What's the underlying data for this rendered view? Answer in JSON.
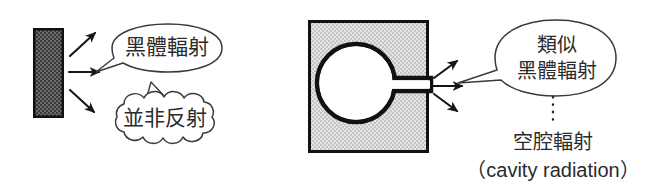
{
  "figure": {
    "title_text": "",
    "background_color": "#ffffff",
    "ink_color": "#1a1a1a",
    "text_color": "#2b2b2b"
  },
  "left_panel": {
    "name": "blackbody-slab-panel",
    "slab": {
      "name": "blackbody-slab",
      "fill_color": "#575757",
      "border_color": "#111111",
      "pattern": "checkered-dither-dark"
    },
    "emission_arrows": {
      "name": "emission-arrows",
      "count": 3,
      "directions": [
        "up-right",
        "right",
        "down-right"
      ]
    },
    "callout_bubble": {
      "name": "blackbody-radiation-bubble",
      "shape": "oval-speech-bubble",
      "label": "黑體輻射"
    },
    "thought_bubble": {
      "name": "not-reflection-bubble",
      "shape": "cloud-bubble",
      "label": "並非反射"
    }
  },
  "right_panel": {
    "name": "cavity-panel",
    "cavity_block": {
      "name": "cavity-block",
      "fill_color": "#d8d8d8",
      "border_color": "#111111",
      "pattern": "checkered-dither-light",
      "cavity_fill": "#ffffff"
    },
    "emission_arrows": {
      "name": "cavity-emission-arrows",
      "count": 3,
      "directions": [
        "up-right",
        "right",
        "down-right"
      ]
    },
    "callout_bubble": {
      "name": "similar-blackbody-bubble",
      "shape": "oval-speech-bubble",
      "label_line1": "類似",
      "label_line2": "黑體輻射"
    },
    "connector": {
      "name": "dotted-connector",
      "style": "dotted-vertical"
    },
    "caption": {
      "name": "cavity-radiation-caption",
      "line1": "空腔輻射",
      "line2": "（cavity radiation）"
    }
  }
}
